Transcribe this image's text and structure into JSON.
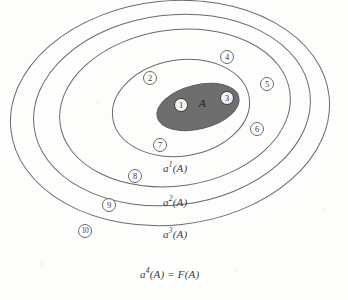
{
  "figure": {
    "background_color": "#fdfdfc",
    "stroke_color": "#6a6a6a",
    "blob_fill_color": "#6e6e6e",
    "blob_label": "A"
  },
  "rings": [
    {
      "id": "a1",
      "label_a": "a",
      "label_sup": "1",
      "label_arg": "(A)",
      "label_text": "a1(A)",
      "cx": 181,
      "cy": 108,
      "rx": 69,
      "ry": 48,
      "rot": -9
    },
    {
      "id": "a2",
      "label_a": "a",
      "label_sup": "2",
      "label_arg": "(A)",
      "label_text": "a2(A)",
      "cx": 175,
      "cy": 108,
      "rx": 116,
      "ry": 78,
      "rot": -8
    },
    {
      "id": "a3",
      "label_a": "a",
      "label_sup": "3",
      "label_arg": "(A)",
      "label_text": "a3(A)",
      "cx": 172,
      "cy": 110,
      "rx": 139,
      "ry": 95,
      "rot": -7
    },
    {
      "id": "a4",
      "label_a": "a",
      "label_sup": "4",
      "label_arg": "(A) = F(A)",
      "label_text": "a4(A) = F(A)",
      "cx": 170,
      "cy": 113,
      "rx": 160,
      "ry": 112,
      "rot": -6
    }
  ],
  "ring_labels": [
    {
      "text": "a",
      "sup": "1",
      "rest": "(A)",
      "x": 163,
      "y": 166
    },
    {
      "text": "a",
      "sup": "2",
      "rest": "(A)",
      "x": 163,
      "y": 200
    },
    {
      "text": "a",
      "sup": "3",
      "rest": "(A)",
      "x": 163,
      "y": 232
    },
    {
      "text": "a",
      "sup": "4",
      "rest": "(A) = F(A)",
      "x": 142,
      "y": 272
    }
  ],
  "nodes": [
    {
      "label": "1",
      "x": 181,
      "y": 105,
      "on_blob": true
    },
    {
      "label": "2",
      "x": 150,
      "y": 78,
      "on_blob": false
    },
    {
      "label": "3",
      "x": 227,
      "y": 98,
      "on_blob": true
    },
    {
      "label": "4",
      "x": 227,
      "y": 57,
      "on_blob": false
    },
    {
      "label": "5",
      "x": 267,
      "y": 84,
      "on_blob": false
    },
    {
      "label": "6",
      "x": 257,
      "y": 129,
      "on_blob": false
    },
    {
      "label": "7",
      "x": 160,
      "y": 145,
      "on_blob": false
    },
    {
      "label": "8",
      "x": 135,
      "y": 176,
      "on_blob": false
    },
    {
      "label": "9",
      "x": 109,
      "y": 205,
      "on_blob": false
    },
    {
      "label": "10",
      "x": 85,
      "y": 231,
      "on_blob": false
    }
  ],
  "blob": {
    "label": "A",
    "label_x": 203,
    "label_y": 104,
    "cx": 198,
    "cy": 107,
    "rx": 42,
    "ry": 22,
    "rot": -14
  }
}
